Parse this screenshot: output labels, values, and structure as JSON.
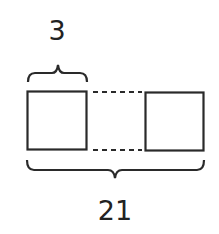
{
  "diagram": {
    "top_label": "3",
    "bottom_label": "21",
    "stroke_color": "#2a2a2a",
    "shapes": [
      {
        "name": "left-square",
        "type": "square"
      },
      {
        "name": "right-square",
        "type": "square"
      }
    ],
    "connectors": [
      "dashed-line-top",
      "dashed-line-bottom"
    ],
    "braces": [
      "top-brace",
      "bottom-brace"
    ]
  }
}
